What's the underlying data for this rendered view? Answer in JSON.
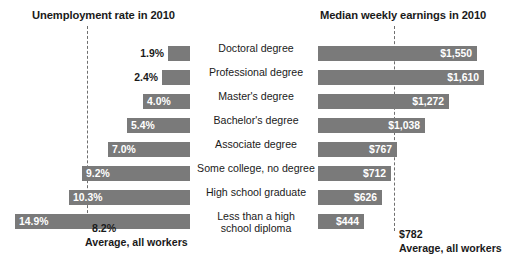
{
  "chart_data": {
    "type": "bar",
    "title": "",
    "layout": "diverging-back-to-back",
    "grid": false,
    "legend": "none",
    "categories": [
      "Doctoral degree",
      "Professional degree",
      "Master's degree",
      "Bachelor's degree",
      "Associate degree",
      "Some college, no degree",
      "High school graduate",
      "Less than a high\nschool diploma"
    ],
    "series": [
      {
        "name": "Unemployment rate in 2010",
        "side": "left",
        "unit": "percent",
        "values": [
          1.9,
          2.4,
          4.0,
          5.4,
          7.0,
          9.2,
          10.3,
          14.9
        ],
        "labels": [
          "1.9%",
          "2.4%",
          "4.0%",
          "5.4%",
          "7.0%",
          "9.2%",
          "10.3%",
          "14.9%"
        ],
        "reference_line": {
          "value": 8.2,
          "label": "8.2%",
          "caption": "Average, all workers"
        },
        "axis_max": 16.0
      },
      {
        "name": "Median weekly earnings in 2010",
        "side": "right",
        "unit": "usd-per-week",
        "values": [
          1550,
          1610,
          1272,
          1038,
          767,
          712,
          626,
          444
        ],
        "labels": [
          "$1,550",
          "$1,610",
          "$1,272",
          "$1,038",
          "$767",
          "$712",
          "$626",
          "$444"
        ],
        "reference_line": {
          "value": 782,
          "label": "$782",
          "caption": "Average, all workers"
        },
        "axis_max": 1750
      }
    ]
  },
  "headers": {
    "left": "Unemployment rate in 2010",
    "right": "Median weekly earnings in 2010"
  },
  "footers": {
    "left_value": "8.2%",
    "left_caption": "Average, all workers",
    "right_value": "$782",
    "right_caption": "Average, all workers"
  },
  "colors": {
    "bar": "#7a7a7a",
    "bar_label": "#ffffff",
    "bar_label_outside": "#1a1a1a",
    "reference_line": "#6f6f6f",
    "text": "#1a1a1a",
    "background": "#ffffff"
  }
}
